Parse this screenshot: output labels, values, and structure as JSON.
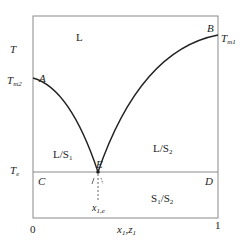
{
  "diagram": {
    "type": "binary eutectic phase diagram",
    "axes": {
      "y_label": "T",
      "x_label_main": "x",
      "x_label_sub1": "1",
      "x_label_sep": ",",
      "x_label_main2": "z",
      "x_label_sub2": "1",
      "x_tick_left": "0",
      "x_tick_right": "1"
    },
    "temperatures": {
      "tm2_main": "T",
      "tm2_sub": "m2",
      "tm1_main": "T",
      "tm1_sub": "m1",
      "te_main": "T",
      "te_sub": "e"
    },
    "points": {
      "A": "A",
      "B": "B",
      "C": "C",
      "D": "D",
      "E": "E"
    },
    "regions": {
      "liquid": "L",
      "l_s1_main": "L/S",
      "l_s1_sub": "1",
      "l_s2_main": "L/S",
      "l_s2_sub": "2",
      "s1_s2_a": "S",
      "s1_s2_a_sub": "1",
      "s1_s2_sep": "/S",
      "s1_s2_b_sub": "2"
    },
    "eutectic_composition": {
      "main": "x",
      "sub": "1,e"
    },
    "colors": {
      "frame": "#8a8a8a",
      "curve": "#222222",
      "text": "#222222"
    }
  }
}
